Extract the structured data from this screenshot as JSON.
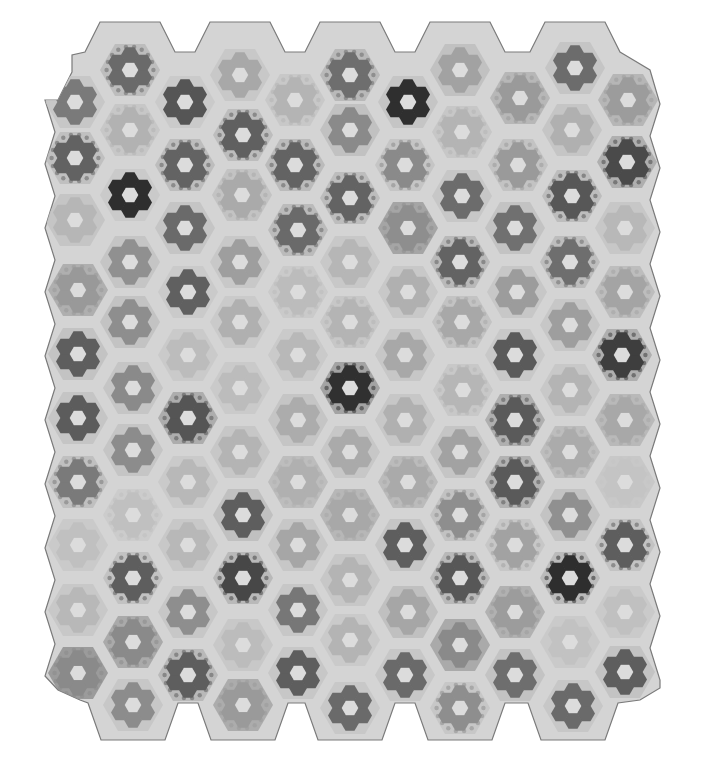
{
  "image": {
    "subject": "Grandmother's Flower Garden hexagon quilt (grayscale photograph)",
    "width": 703,
    "height": 777
  },
  "colors": {
    "background": "#ffffff",
    "quilt_base": "#d4d4d4",
    "edge": "#7a7a7a",
    "center": "#dcdcdc"
  },
  "grid": {
    "columns_x": [
      75,
      130,
      185,
      240,
      295,
      350,
      405,
      460,
      515,
      570,
      625
    ],
    "hex_radius": 30,
    "petal_radius": 9
  },
  "rosettes": [
    {
      "x": 130,
      "y": 70,
      "tone": "#6a6a6a",
      "ring": "#b9b9b9",
      "speck": true
    },
    {
      "x": 240,
      "y": 75,
      "tone": "#a8a8a8",
      "ring": "#c6c6c6"
    },
    {
      "x": 350,
      "y": 75,
      "tone": "#6e6e6e",
      "ring": "#b4b4b4",
      "speck": true
    },
    {
      "x": 460,
      "y": 70,
      "tone": "#a2a2a2",
      "ring": "#bdbdbd"
    },
    {
      "x": 575,
      "y": 68,
      "tone": "#6c6c6c",
      "ring": "#c2c2c2"
    },
    {
      "x": 75,
      "y": 102,
      "tone": "#7a7a7a",
      "ring": "#c4c4c4"
    },
    {
      "x": 185,
      "y": 102,
      "tone": "#555555",
      "ring": "#c8c8c8"
    },
    {
      "x": 295,
      "y": 100,
      "tone": "#b4b4b4",
      "ring": "#c6c6c6",
      "speck": true
    },
    {
      "x": 408,
      "y": 102,
      "tone": "#2f2f2f",
      "ring": "#c2c2c2"
    },
    {
      "x": 520,
      "y": 98,
      "tone": "#9a9a9a",
      "ring": "#b2b2b2",
      "speck": true
    },
    {
      "x": 628,
      "y": 100,
      "tone": "#9c9c9c",
      "ring": "#b0b0b0",
      "speck": true
    },
    {
      "x": 130,
      "y": 130,
      "tone": "#b2b2b2",
      "ring": "#c4c4c4",
      "speck": true
    },
    {
      "x": 243,
      "y": 135,
      "tone": "#606060",
      "ring": "#b8b8b8",
      "speck": true
    },
    {
      "x": 350,
      "y": 130,
      "tone": "#8a8a8a",
      "ring": "#bdbdbd"
    },
    {
      "x": 462,
      "y": 132,
      "tone": "#b4b4b4",
      "ring": "#c4c4c4",
      "speck": true
    },
    {
      "x": 572,
      "y": 130,
      "tone": "#b0b0b0",
      "ring": "#c2c2c2"
    },
    {
      "x": 75,
      "y": 158,
      "tone": "#626262",
      "ring": "#bcbcbc",
      "speck": true
    },
    {
      "x": 185,
      "y": 165,
      "tone": "#636363",
      "ring": "#b8b8b8",
      "speck": true
    },
    {
      "x": 295,
      "y": 165,
      "tone": "#636363",
      "ring": "#b6b6b6",
      "speck": true
    },
    {
      "x": 405,
      "y": 165,
      "tone": "#8a8a8a",
      "ring": "#c2c2c2",
      "speck": true
    },
    {
      "x": 518,
      "y": 165,
      "tone": "#9a9a9a",
      "ring": "#c0c0c0",
      "speck": true
    },
    {
      "x": 627,
      "y": 162,
      "tone": "#4a4a4a",
      "ring": "#a8a8a8",
      "speck": true
    },
    {
      "x": 130,
      "y": 195,
      "tone": "#2e2e2e",
      "ring": "#c8c8c8"
    },
    {
      "x": 242,
      "y": 195,
      "tone": "#aaaaaa",
      "ring": "#c0c0c0",
      "speck": true
    },
    {
      "x": 350,
      "y": 198,
      "tone": "#636363",
      "ring": "#b8b8b8",
      "speck": true
    },
    {
      "x": 462,
      "y": 196,
      "tone": "#6c6c6c",
      "ring": "#c4c4c4"
    },
    {
      "x": 572,
      "y": 196,
      "tone": "#575757",
      "ring": "#b8b8b8",
      "speck": true
    },
    {
      "x": 75,
      "y": 220,
      "tone": "#b6b6b6",
      "ring": "#c2c2c2"
    },
    {
      "x": 185,
      "y": 228,
      "tone": "#6a6a6a",
      "ring": "#c2c2c2"
    },
    {
      "x": 298,
      "y": 230,
      "tone": "#6a6a6a",
      "ring": "#b6b6b6",
      "speck": true
    },
    {
      "x": 408,
      "y": 228,
      "tone": "#8e8e8e",
      "ring": "#9c9c9c",
      "speck": true
    },
    {
      "x": 515,
      "y": 228,
      "tone": "#707070",
      "ring": "#c0c0c0"
    },
    {
      "x": 625,
      "y": 228,
      "tone": "#b8b8b8",
      "ring": "#c4c4c4"
    },
    {
      "x": 130,
      "y": 262,
      "tone": "#909090",
      "ring": "#c2c2c2"
    },
    {
      "x": 240,
      "y": 262,
      "tone": "#9e9e9e",
      "ring": "#c6c6c6"
    },
    {
      "x": 350,
      "y": 262,
      "tone": "#b6b6b6",
      "ring": "#c6c6c6"
    },
    {
      "x": 460,
      "y": 262,
      "tone": "#636363",
      "ring": "#b4b4b4",
      "speck": true
    },
    {
      "x": 570,
      "y": 262,
      "tone": "#6e6e6e",
      "ring": "#b8b8b8",
      "speck": true
    },
    {
      "x": 78,
      "y": 290,
      "tone": "#999999",
      "ring": "#a8a8a8",
      "speck": true
    },
    {
      "x": 188,
      "y": 292,
      "tone": "#606060",
      "ring": "#c8c8c8"
    },
    {
      "x": 298,
      "y": 292,
      "tone": "#bcbcbc",
      "ring": "#c8c8c8",
      "speck": true
    },
    {
      "x": 408,
      "y": 292,
      "tone": "#b0b0b0",
      "ring": "#c6c6c6"
    },
    {
      "x": 517,
      "y": 292,
      "tone": "#9c9c9c",
      "ring": "#c4c4c4"
    },
    {
      "x": 625,
      "y": 292,
      "tone": "#a4a4a4",
      "ring": "#b8b8b8",
      "speck": true
    },
    {
      "x": 130,
      "y": 322,
      "tone": "#8e8e8e",
      "ring": "#c0c0c0"
    },
    {
      "x": 240,
      "y": 322,
      "tone": "#b0b0b0",
      "ring": "#c8c8c8"
    },
    {
      "x": 350,
      "y": 322,
      "tone": "#b4b4b4",
      "ring": "#c4c4c4",
      "speck": true
    },
    {
      "x": 462,
      "y": 322,
      "tone": "#a8a8a8",
      "ring": "#c0c0c0",
      "speck": true
    },
    {
      "x": 570,
      "y": 325,
      "tone": "#9e9e9e",
      "ring": "#c4c4c4"
    },
    {
      "x": 78,
      "y": 354,
      "tone": "#5e5e5e",
      "ring": "#c0c0c0"
    },
    {
      "x": 188,
      "y": 355,
      "tone": "#bcbcbc",
      "ring": "#c8c8c8"
    },
    {
      "x": 298,
      "y": 355,
      "tone": "#b8b8b8",
      "ring": "#c8c8c8"
    },
    {
      "x": 405,
      "y": 355,
      "tone": "#a8a8a8",
      "ring": "#c4c4c4"
    },
    {
      "x": 515,
      "y": 355,
      "tone": "#5a5a5a",
      "ring": "#c6c6c6"
    },
    {
      "x": 622,
      "y": 355,
      "tone": "#3e3e3e",
      "ring": "#a8a8a8",
      "speck": true
    },
    {
      "x": 133,
      "y": 388,
      "tone": "#8a8a8a",
      "ring": "#c2c2c2"
    },
    {
      "x": 240,
      "y": 388,
      "tone": "#bcbcbc",
      "ring": "#c8c8c8"
    },
    {
      "x": 350,
      "y": 388,
      "tone": "#303030",
      "ring": "#9a9a9a",
      "speck": true
    },
    {
      "x": 463,
      "y": 390,
      "tone": "#b6b6b6",
      "ring": "#c6c6c6",
      "speck": true
    },
    {
      "x": 570,
      "y": 390,
      "tone": "#b4b4b4",
      "ring": "#c6c6c6"
    },
    {
      "x": 78,
      "y": 418,
      "tone": "#5c5c5c",
      "ring": "#c2c2c2"
    },
    {
      "x": 188,
      "y": 418,
      "tone": "#555555",
      "ring": "#a6a6a6",
      "speck": true
    },
    {
      "x": 298,
      "y": 420,
      "tone": "#acacac",
      "ring": "#c2c2c2"
    },
    {
      "x": 405,
      "y": 420,
      "tone": "#b0b0b0",
      "ring": "#c4c4c4"
    },
    {
      "x": 515,
      "y": 420,
      "tone": "#5a5a5a",
      "ring": "#a8a8a8",
      "speck": true
    },
    {
      "x": 625,
      "y": 420,
      "tone": "#a8a8a8",
      "ring": "#b4b4b4",
      "speck": true
    },
    {
      "x": 133,
      "y": 450,
      "tone": "#8c8c8c",
      "ring": "#c2c2c2"
    },
    {
      "x": 240,
      "y": 452,
      "tone": "#b4b4b4",
      "ring": "#c4c4c4"
    },
    {
      "x": 350,
      "y": 452,
      "tone": "#aaaaaa",
      "ring": "#c4c4c4"
    },
    {
      "x": 460,
      "y": 452,
      "tone": "#a2a2a2",
      "ring": "#c2c2c2"
    },
    {
      "x": 570,
      "y": 452,
      "tone": "#ababab",
      "ring": "#b8b8b8",
      "speck": true
    },
    {
      "x": 78,
      "y": 482,
      "tone": "#7a7a7a",
      "ring": "#bcbcbc",
      "speck": true
    },
    {
      "x": 188,
      "y": 482,
      "tone": "#b8b8b8",
      "ring": "#c8c8c8"
    },
    {
      "x": 298,
      "y": 482,
      "tone": "#b0b0b0",
      "ring": "#b8b8b8",
      "speck": true
    },
    {
      "x": 408,
      "y": 482,
      "tone": "#aaaaaa",
      "ring": "#b6b6b6",
      "speck": true
    },
    {
      "x": 515,
      "y": 482,
      "tone": "#5a5a5a",
      "ring": "#acacac",
      "speck": true
    },
    {
      "x": 625,
      "y": 482,
      "tone": "#c4c4c4",
      "ring": "#c6c6c6",
      "speck": true
    },
    {
      "x": 133,
      "y": 515,
      "tone": "#c0c0c0",
      "ring": "#cacaca",
      "speck": true
    },
    {
      "x": 243,
      "y": 515,
      "tone": "#5e5e5e",
      "ring": "#bcbcbc"
    },
    {
      "x": 350,
      "y": 515,
      "tone": "#a8a8a8",
      "ring": "#b2b2b2",
      "speck": true
    },
    {
      "x": 460,
      "y": 515,
      "tone": "#8e8e8e",
      "ring": "#bebebe",
      "speck": true
    },
    {
      "x": 570,
      "y": 515,
      "tone": "#909090",
      "ring": "#c0c0c0"
    },
    {
      "x": 78,
      "y": 545,
      "tone": "#c0c0c0",
      "ring": "#c8c8c8"
    },
    {
      "x": 188,
      "y": 545,
      "tone": "#b8b8b8",
      "ring": "#c6c6c6"
    },
    {
      "x": 298,
      "y": 545,
      "tone": "#a6a6a6",
      "ring": "#c4c4c4"
    },
    {
      "x": 405,
      "y": 545,
      "tone": "#5e5e5e",
      "ring": "#c2c2c2"
    },
    {
      "x": 515,
      "y": 545,
      "tone": "#a2a2a2",
      "ring": "#c4c4c4",
      "speck": true
    },
    {
      "x": 625,
      "y": 545,
      "tone": "#5e5e5e",
      "ring": "#c0c0c0",
      "speck": true
    },
    {
      "x": 133,
      "y": 578,
      "tone": "#5e5e5e",
      "ring": "#bebebe",
      "speck": true
    },
    {
      "x": 243,
      "y": 578,
      "tone": "#474747",
      "ring": "#b4b4b4",
      "speck": true
    },
    {
      "x": 350,
      "y": 580,
      "tone": "#b4b4b4",
      "ring": "#c4c4c4"
    },
    {
      "x": 460,
      "y": 578,
      "tone": "#575757",
      "ring": "#b4b4b4",
      "speck": true
    },
    {
      "x": 570,
      "y": 578,
      "tone": "#2e2e2e",
      "ring": "#b6b6b6",
      "speck": true
    },
    {
      "x": 78,
      "y": 610,
      "tone": "#b8b8b8",
      "ring": "#c6c6c6"
    },
    {
      "x": 188,
      "y": 612,
      "tone": "#8e8e8e",
      "ring": "#c4c4c4"
    },
    {
      "x": 298,
      "y": 610,
      "tone": "#777777",
      "ring": "#c4c4c4"
    },
    {
      "x": 408,
      "y": 612,
      "tone": "#a6a6a6",
      "ring": "#bcbcbc"
    },
    {
      "x": 515,
      "y": 612,
      "tone": "#9c9c9c",
      "ring": "#aaaaaa",
      "speck": true
    },
    {
      "x": 625,
      "y": 612,
      "tone": "#c0c0c0",
      "ring": "#c8c8c8"
    },
    {
      "x": 133,
      "y": 642,
      "tone": "#8a8a8a",
      "ring": "#a2a2a2",
      "speck": true
    },
    {
      "x": 243,
      "y": 645,
      "tone": "#bcbcbc",
      "ring": "#c6c6c6"
    },
    {
      "x": 350,
      "y": 640,
      "tone": "#b4b4b4",
      "ring": "#c8c8c8"
    },
    {
      "x": 460,
      "y": 645,
      "tone": "#8a8a8a",
      "ring": "#a2a2a2"
    },
    {
      "x": 570,
      "y": 642,
      "tone": "#c2c2c2",
      "ring": "#c8c8c8"
    },
    {
      "x": 78,
      "y": 673,
      "tone": "#8a8a8a",
      "ring": "#909090",
      "speck": true
    },
    {
      "x": 188,
      "y": 675,
      "tone": "#5e5e5e",
      "ring": "#b4b4b4",
      "speck": true
    },
    {
      "x": 298,
      "y": 673,
      "tone": "#5e5e5e",
      "ring": "#c4c4c4"
    },
    {
      "x": 405,
      "y": 675,
      "tone": "#6a6a6a",
      "ring": "#c4c4c4"
    },
    {
      "x": 515,
      "y": 675,
      "tone": "#6e6e6e",
      "ring": "#c0c0c0"
    },
    {
      "x": 625,
      "y": 672,
      "tone": "#5e5e5e",
      "ring": "#c0c0c0"
    },
    {
      "x": 133,
      "y": 705,
      "tone": "#8c8c8c",
      "ring": "#c4c4c4"
    },
    {
      "x": 243,
      "y": 705,
      "tone": "#9a9a9a",
      "ring": "#a4a4a4",
      "speck": true
    },
    {
      "x": 350,
      "y": 708,
      "tone": "#6a6a6a",
      "ring": "#c6c6c6"
    },
    {
      "x": 460,
      "y": 708,
      "tone": "#8e8e8e",
      "ring": "#c4c4c4",
      "speck": true
    },
    {
      "x": 573,
      "y": 706,
      "tone": "#6a6a6a",
      "ring": "#c4c4c4"
    }
  ]
}
